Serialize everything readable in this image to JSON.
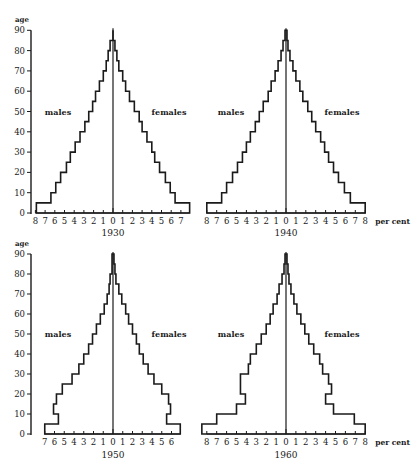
{
  "figure": {
    "y_axis_title": "age",
    "x_unit_label": "per cent",
    "series_labels": {
      "left": "males",
      "right": "females"
    },
    "colors": {
      "ink": "#1a1a1a",
      "background": "#ffffff"
    }
  },
  "chart_data": [
    {
      "type": "bar",
      "subtype": "population-pyramid",
      "title": "1930",
      "xlabel": "per cent",
      "ylabel": "age",
      "age_groups": [
        "0-5",
        "5-10",
        "10-15",
        "15-20",
        "20-25",
        "25-30",
        "30-35",
        "35-40",
        "40-45",
        "45-50",
        "50-55",
        "55-60",
        "60-65",
        "65-70",
        "70-75",
        "75-80",
        "80-85",
        "85-90"
      ],
      "series": [
        {
          "name": "males",
          "values": [
            7.9,
            6.4,
            5.9,
            5.4,
            4.8,
            4.4,
            3.9,
            3.4,
            2.9,
            2.5,
            2.1,
            1.8,
            1.4,
            1.0,
            0.7,
            0.5,
            0.3,
            0.0
          ]
        },
        {
          "name": "females",
          "values": [
            7.9,
            6.4,
            5.9,
            5.4,
            4.8,
            4.3,
            4.0,
            3.5,
            3.0,
            2.7,
            2.2,
            1.7,
            1.3,
            1.0,
            0.6,
            0.4,
            0.2,
            0.0
          ]
        }
      ],
      "x_ticks_left": [
        "8",
        "7",
        "6",
        "5",
        "4",
        "3",
        "2",
        "1"
      ],
      "x_ticks_right": [
        "0",
        "1",
        "2",
        "3",
        "4",
        "5",
        "6",
        "7"
      ],
      "y_ticks": [
        "0",
        "10",
        "20",
        "30",
        "40",
        "50",
        "60",
        "70",
        "80",
        "90"
      ],
      "xlim": [
        -8,
        7.9
      ],
      "ylim": [
        0,
        90
      ],
      "grid": false
    },
    {
      "type": "bar",
      "subtype": "population-pyramid",
      "title": "1940",
      "xlabel": "per cent",
      "ylabel": "age",
      "age_groups": [
        "0-5",
        "5-10",
        "10-15",
        "15-20",
        "20-25",
        "25-30",
        "30-35",
        "35-40",
        "40-45",
        "45-50",
        "50-55",
        "55-60",
        "60-65",
        "65-70",
        "70-75",
        "75-80",
        "80-85",
        "85-90"
      ],
      "series": [
        {
          "name": "males",
          "values": [
            8.0,
            6.5,
            6.0,
            5.4,
            4.9,
            4.4,
            4.0,
            3.6,
            3.1,
            2.7,
            2.3,
            1.8,
            1.5,
            1.1,
            0.8,
            0.5,
            0.3,
            0.1
          ]
        },
        {
          "name": "females",
          "values": [
            8.0,
            6.5,
            5.9,
            5.3,
            4.8,
            4.3,
            3.9,
            3.5,
            3.0,
            2.6,
            2.2,
            1.7,
            1.4,
            1.0,
            0.7,
            0.4,
            0.2,
            0.1
          ]
        }
      ],
      "x_ticks_left": [
        "8",
        "7",
        "6",
        "5",
        "4",
        "3",
        "2",
        "1"
      ],
      "x_ticks_right": [
        "0",
        "1",
        "2",
        "3",
        "4",
        "5",
        "6",
        "7",
        "8"
      ],
      "y_ticks": [
        "0",
        "10",
        "20",
        "30",
        "40",
        "50",
        "60",
        "70",
        "80",
        "90"
      ],
      "xlim": [
        -8,
        8
      ],
      "ylim": [
        0,
        90
      ],
      "grid": false
    },
    {
      "type": "bar",
      "subtype": "population-pyramid",
      "title": "1950",
      "xlabel": "per cent",
      "ylabel": "age",
      "age_groups": [
        "0-5",
        "5-10",
        "10-15",
        "15-20",
        "20-25",
        "25-30",
        "30-35",
        "35-40",
        "40-45",
        "45-50",
        "50-55",
        "55-60",
        "60-65",
        "65-70",
        "70-75",
        "75-80",
        "80-85",
        "85-90"
      ],
      "series": [
        {
          "name": "males",
          "values": [
            7.0,
            5.6,
            6.1,
            5.8,
            5.2,
            4.2,
            3.5,
            3.0,
            2.5,
            2.1,
            1.7,
            1.3,
            0.9,
            0.6,
            0.4,
            0.3,
            0.1,
            0.1
          ]
        },
        {
          "name": "females",
          "values": [
            6.9,
            5.5,
            5.9,
            5.7,
            5.0,
            4.2,
            3.6,
            3.1,
            2.7,
            2.4,
            2.0,
            1.6,
            1.3,
            0.9,
            0.6,
            0.3,
            0.2,
            0.1
          ]
        }
      ],
      "x_ticks_left": [
        "7",
        "6",
        "5",
        "4",
        "3",
        "2",
        "1"
      ],
      "x_ticks_right": [
        "0",
        "1",
        "2",
        "3",
        "4",
        "5",
        "6"
      ],
      "y_ticks": [
        "0",
        "10",
        "20",
        "30",
        "40",
        "50",
        "60",
        "70",
        "80",
        "90"
      ],
      "xlim": [
        -7,
        6.9
      ],
      "ylim": [
        0,
        90
      ],
      "grid": false
    },
    {
      "type": "bar",
      "subtype": "population-pyramid",
      "title": "1960",
      "xlabel": "per cent",
      "ylabel": "age",
      "age_groups": [
        "0-5",
        "5-10",
        "10-15",
        "15-20",
        "20-25",
        "25-30",
        "30-35",
        "35-40",
        "40-45",
        "45-50",
        "50-55",
        "55-60",
        "60-65",
        "65-70",
        "70-75",
        "75-80",
        "80-85",
        "85-90"
      ],
      "series": [
        {
          "name": "males",
          "values": [
            8.5,
            7.0,
            5.0,
            4.1,
            4.6,
            4.6,
            3.8,
            3.6,
            3.0,
            2.5,
            2.0,
            1.6,
            1.3,
            0.9,
            0.7,
            0.4,
            0.2,
            0.1
          ]
        },
        {
          "name": "females",
          "values": [
            8.0,
            6.9,
            4.8,
            4.0,
            4.6,
            4.3,
            3.7,
            3.4,
            2.8,
            2.3,
            1.9,
            1.5,
            1.1,
            0.8,
            0.5,
            0.3,
            0.2,
            0.1
          ]
        }
      ],
      "x_ticks_left": [
        "8",
        "7",
        "6",
        "5",
        "4",
        "3",
        "2",
        "1"
      ],
      "x_ticks_right": [
        "0",
        "1",
        "2",
        "3",
        "4",
        "5",
        "6",
        "7",
        "8"
      ],
      "y_ticks": [
        "0",
        "10",
        "20",
        "30",
        "40",
        "50",
        "60",
        "70",
        "80",
        "90"
      ],
      "xlim": [
        -8,
        8
      ],
      "ylim": [
        0,
        90
      ],
      "grid": false
    }
  ]
}
